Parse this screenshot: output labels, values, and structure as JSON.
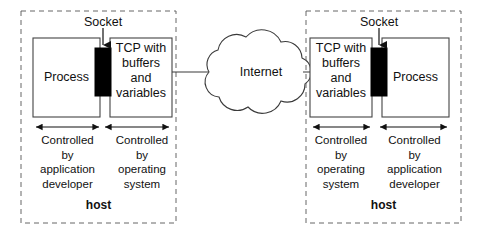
{
  "diagram": {
    "colors": {
      "stroke": "#3a3a3a",
      "box_stroke": "#444444",
      "socket_fill": "#000000",
      "text": "#111111",
      "background": "#ffffff",
      "dashed_stroke": "#666666"
    },
    "network": {
      "cloud_label": "Internet"
    },
    "hosts": [
      {
        "id": "left-host",
        "host_label": "host",
        "socket_label": "Socket",
        "process_label": "Process",
        "tcp_label_lines": [
          "TCP with",
          "buffers",
          "and",
          "variables"
        ],
        "spans": [
          {
            "id": "left-span-app",
            "lines": [
              "Controlled",
              "by",
              "application",
              "developer"
            ]
          },
          {
            "id": "left-span-os",
            "lines": [
              "Controlled",
              "by",
              "operating",
              "system"
            ]
          }
        ]
      },
      {
        "id": "right-host",
        "host_label": "host",
        "socket_label": "Socket",
        "process_label": "Process",
        "tcp_label_lines": [
          "TCP with",
          "buffers",
          "and",
          "variables"
        ],
        "spans": [
          {
            "id": "right-span-os",
            "lines": [
              "Controlled",
              "by",
              "operating",
              "system"
            ]
          },
          {
            "id": "right-span-app",
            "lines": [
              "Controlled",
              "by",
              "application",
              "developer"
            ]
          }
        ]
      }
    ]
  }
}
